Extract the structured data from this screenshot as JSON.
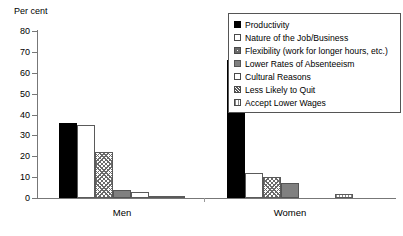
{
  "chart_data": {
    "type": "bar",
    "title": "",
    "subtitle": "",
    "xlabel": "",
    "ylabel": "Per cent",
    "ylim": [
      0,
      80
    ],
    "ytick_step": 10,
    "yticks": [
      80,
      70,
      60,
      50,
      40,
      30,
      20,
      10,
      0
    ],
    "grid": false,
    "legend_position": "top-right",
    "categories": [
      "Men",
      "Women"
    ],
    "series": [
      {
        "name": "Productivity",
        "pattern": "solid-black",
        "values": [
          36,
          66
        ]
      },
      {
        "name": "Nature of the Job/Business",
        "pattern": "white",
        "values": [
          35,
          12
        ]
      },
      {
        "name": "Flexibility (work for longer hours, etc.)",
        "pattern": "crosshatch",
        "values": [
          22,
          10
        ]
      },
      {
        "name": "Lower Rates of Absenteeism",
        "pattern": "gray",
        "values": [
          4,
          7
        ]
      },
      {
        "name": "Cultural Reasons",
        "pattern": "dotted",
        "values": [
          3,
          0
        ]
      },
      {
        "name": "Less Likely to Quit",
        "pattern": "hatch",
        "values": [
          1,
          0
        ]
      },
      {
        "name": "Accept Lower Wages",
        "pattern": "vlines",
        "values": [
          0.5,
          2
        ]
      }
    ]
  },
  "axis": {
    "y_title": "Per cent",
    "tick_labels": [
      "80",
      "70",
      "60",
      "50",
      "40",
      "30",
      "20",
      "10",
      "0"
    ]
  },
  "group_labels": [
    "Men",
    "Women"
  ],
  "legend": {
    "items": [
      {
        "label": "Productivity",
        "pattern": "solid-black"
      },
      {
        "label": "Nature of the Job/Business",
        "pattern": "white"
      },
      {
        "label": "Flexibility (work for longer hours, etc.)",
        "pattern": "crosshatch"
      },
      {
        "label": "Lower Rates of Absenteeism",
        "pattern": "gray"
      },
      {
        "label": "Cultural Reasons",
        "pattern": "dotted"
      },
      {
        "label": "Less Likely to Quit",
        "pattern": "hatch"
      },
      {
        "label": "Accept Lower Wages",
        "pattern": "vlines"
      }
    ]
  },
  "colors": {
    "solid_black": "#000000",
    "white": "#ffffff",
    "gray": "#808080",
    "outline": "#5a5a5a",
    "axis": "#777777"
  }
}
